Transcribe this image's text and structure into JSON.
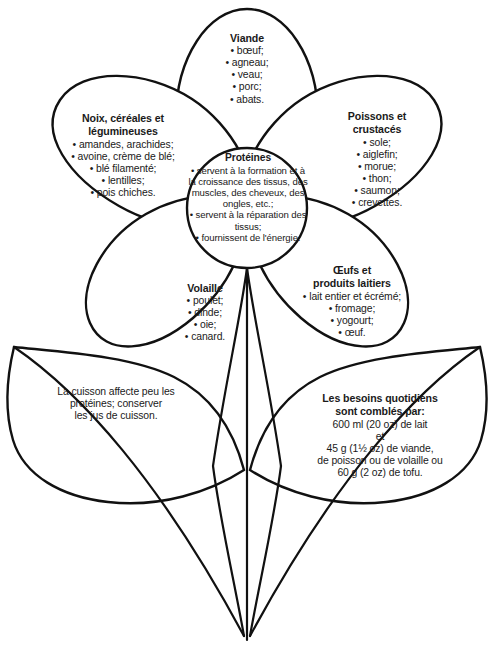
{
  "diagram": {
    "line_color": "#111111",
    "text_color": "#1a1a1a",
    "background": "#ffffff"
  },
  "center": {
    "heading": "Protéines",
    "items": [
      "servent à la formation et à la croissance des tissus, des muscles, des cheveux, des ongles, etc.;",
      "servent à la réparation des tissus;",
      "fournissent de l'énergie."
    ]
  },
  "petals": [
    {
      "id": "viande",
      "heading": "Viande",
      "items": [
        "bœuf;",
        "agneau;",
        "veau;",
        "porc;",
        "abats."
      ]
    },
    {
      "id": "noix",
      "heading": "Noix, céréales et légumineuses",
      "heading_line1": "Noix, céréales et",
      "heading_line2": "légumineuses",
      "items": [
        "amandes, arachides;",
        "avoine, crème de blé;",
        "blé filamenté;",
        "lentilles;",
        "pois chiches."
      ]
    },
    {
      "id": "poissons",
      "heading": "Poissons et crustacés",
      "heading_line1": "Poissons et",
      "heading_line2": "crustacés",
      "items": [
        "sole;",
        "aiglefin;",
        "morue;",
        "thon;",
        "saumon;",
        "crevettes."
      ]
    },
    {
      "id": "volaille",
      "heading": "Volaille",
      "items": [
        "poulet;",
        "dinde;",
        "oie;",
        "canard."
      ]
    },
    {
      "id": "oeufs",
      "heading": "Œufs et produits laitiers",
      "heading_line1": "Œufs et",
      "heading_line2": "produits laitiers",
      "items": [
        "lait entier et écrémé;",
        "fromage;",
        "yogourt;",
        "œuf."
      ]
    }
  ],
  "leaves": [
    {
      "id": "cuisson",
      "lines": [
        "La cuisson affecte peu les",
        "protéines; conserver",
        "les jus de cuisson."
      ]
    },
    {
      "id": "besoins",
      "heading_line1": "Les besoins quotidiens",
      "heading_line2": "sont comblés par:",
      "lines": [
        "600 ml (20 oz) de lait",
        "et",
        "45 g (1½ oz) de viande,",
        "de poisson ou de volaille ou",
        "60 g (2 oz) de tofu."
      ]
    }
  ]
}
